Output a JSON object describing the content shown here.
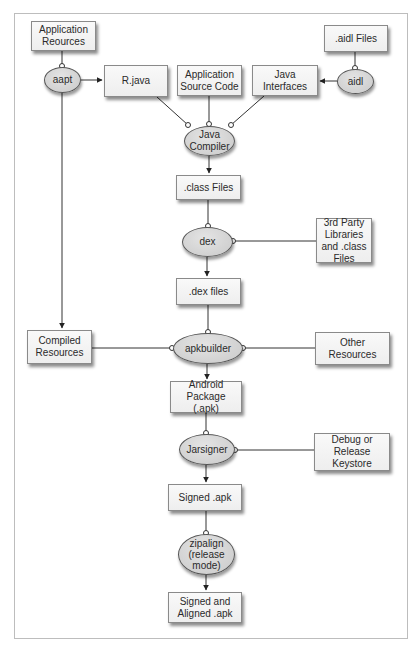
{
  "colors": {
    "box_fill": "#f4f4f4",
    "box_border": "#8a8a8a",
    "ellipse_fill": "#d4d4d4",
    "ellipse_border": "#555555",
    "line": "#333333",
    "frame": "#bdbdbd"
  },
  "nodes": {
    "app_resources": {
      "label": "Application\nReources",
      "shape": "box"
    },
    "aidl_files": {
      "label": ".aidl Files",
      "shape": "box"
    },
    "aapt": {
      "label": "aapt",
      "shape": "ellipse"
    },
    "aidl": {
      "label": "aidl",
      "shape": "ellipse"
    },
    "r_java": {
      "label": "R.java",
      "shape": "box"
    },
    "app_source": {
      "label": "Application\nSource Code",
      "shape": "box"
    },
    "java_interfaces": {
      "label": "Java\nInterfaces",
      "shape": "box"
    },
    "java_compiler": {
      "label": "Java\nCompiler",
      "shape": "ellipse"
    },
    "class_files": {
      "label": ".class Files",
      "shape": "box"
    },
    "dex": {
      "label": "dex",
      "shape": "ellipse"
    },
    "third_party": {
      "label": "3rd Party\nLibraries\nand .class\nFiles",
      "shape": "box"
    },
    "dex_files": {
      "label": ".dex files",
      "shape": "box"
    },
    "compiled_resources": {
      "label": "Compiled\nResources",
      "shape": "box"
    },
    "apkbuilder": {
      "label": "apkbuilder",
      "shape": "ellipse"
    },
    "other_resources": {
      "label": "Other Resources",
      "shape": "box"
    },
    "android_package": {
      "label": "Android Package\n(.apk)",
      "shape": "box"
    },
    "jarsigner": {
      "label": "Jarsigner",
      "shape": "ellipse"
    },
    "keystore": {
      "label": "Debug or\nRelease\nKeystore",
      "shape": "box"
    },
    "signed_apk": {
      "label": "Signed .apk",
      "shape": "box"
    },
    "zipalign": {
      "label": "zipalign\n(release\nmode)",
      "shape": "ellipse"
    },
    "signed_aligned_apk": {
      "label": "Signed and\nAligned .apk",
      "shape": "box"
    }
  },
  "edges": [
    {
      "from": "app_resources",
      "to": "aapt",
      "type": "input"
    },
    {
      "from": "aapt",
      "to": "r_java",
      "type": "output"
    },
    {
      "from": "aapt",
      "to": "compiled_resources",
      "type": "output"
    },
    {
      "from": "aidl_files",
      "to": "aidl",
      "type": "input"
    },
    {
      "from": "aidl",
      "to": "java_interfaces",
      "type": "output"
    },
    {
      "from": "r_java",
      "to": "java_compiler",
      "type": "input"
    },
    {
      "from": "app_source",
      "to": "java_compiler",
      "type": "input"
    },
    {
      "from": "java_interfaces",
      "to": "java_compiler",
      "type": "input"
    },
    {
      "from": "java_compiler",
      "to": "class_files",
      "type": "output"
    },
    {
      "from": "class_files",
      "to": "dex",
      "type": "input"
    },
    {
      "from": "third_party",
      "to": "dex",
      "type": "input"
    },
    {
      "from": "dex",
      "to": "dex_files",
      "type": "output"
    },
    {
      "from": "dex_files",
      "to": "apkbuilder",
      "type": "input"
    },
    {
      "from": "compiled_resources",
      "to": "apkbuilder",
      "type": "input"
    },
    {
      "from": "other_resources",
      "to": "apkbuilder",
      "type": "input"
    },
    {
      "from": "apkbuilder",
      "to": "android_package",
      "type": "output"
    },
    {
      "from": "android_package",
      "to": "jarsigner",
      "type": "input"
    },
    {
      "from": "keystore",
      "to": "jarsigner",
      "type": "input"
    },
    {
      "from": "jarsigner",
      "to": "signed_apk",
      "type": "output"
    },
    {
      "from": "signed_apk",
      "to": "zipalign",
      "type": "input"
    },
    {
      "from": "zipalign",
      "to": "signed_aligned_apk",
      "type": "output"
    }
  ]
}
